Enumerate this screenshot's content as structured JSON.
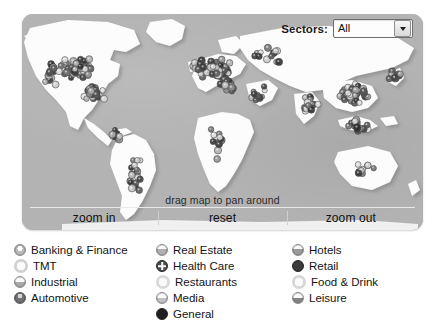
{
  "window": {
    "background": "#ffffff"
  },
  "map": {
    "panel_background": "#b3b3b3",
    "land_color": "#fdfdfd",
    "land_shadow": "#9c9c9c",
    "hint_text": "drag map to pan around",
    "sectors": {
      "label": "Sectors:",
      "selected": "All",
      "options": [
        "All"
      ],
      "arrow_icon": "chevron-down-icon"
    },
    "buttons": [
      {
        "id": "zoom-in",
        "label": "zoom in"
      },
      {
        "id": "reset",
        "label": "reset"
      },
      {
        "id": "zoom-out",
        "label": "zoom out"
      }
    ]
  },
  "legend": {
    "columns": [
      {
        "items": [
          {
            "label": "Banking & Finance",
            "color": "#b9b9b9",
            "marker": "circle-light"
          },
          {
            "label": "TMT",
            "color": "#cfcfcf",
            "marker": "circle-ring"
          },
          {
            "label": "Industrial",
            "color": "#a8a8a8",
            "marker": "circle-half"
          },
          {
            "label": "Automotive",
            "color": "#6f6f6f",
            "marker": "circle-dark"
          }
        ]
      },
      {
        "items": [
          {
            "label": "Real Estate",
            "color": "#b0b0b0",
            "marker": "circle-half"
          },
          {
            "label": "Health Care",
            "color": "#4d4d4d",
            "marker": "circle-cross"
          },
          {
            "label": "Restaurants",
            "color": "#d9d9d9",
            "marker": "circle-ring"
          },
          {
            "label": "Media",
            "color": "#c2c2c2",
            "marker": "circle-half"
          },
          {
            "label": "General",
            "color": "#1f1f1f",
            "marker": "circle-solid"
          }
        ]
      },
      {
        "items": [
          {
            "label": "Hotels",
            "color": "#9a9a9a",
            "marker": "circle-half"
          },
          {
            "label": "Retail",
            "color": "#3b3b3b",
            "marker": "circle-solid"
          },
          {
            "label": "Food & Drink",
            "color": "#d6d6d6",
            "marker": "circle-ring"
          },
          {
            "label": "Leisure",
            "color": "#848484",
            "marker": "circle-half"
          }
        ]
      }
    ]
  }
}
